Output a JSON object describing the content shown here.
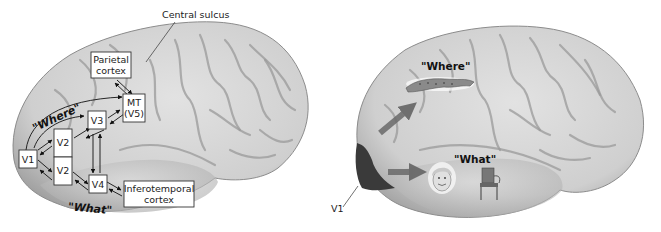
{
  "left_panel": {
    "central_sulcus_label": "Central sulcus",
    "boxes": {
      "parietal_line1": "Parietal",
      "parietal_line2": "cortex",
      "mt_line1": "MT",
      "mt_line2": "(V5)",
      "v3": "V3",
      "v2_upper": "V2",
      "v2_lower": "V2",
      "v1": "V1",
      "v4": "V4",
      "it_line1": "Inferotemporal",
      "it_line2": "cortex"
    },
    "where_label": "\"Where\"",
    "what_label": "\"What\""
  },
  "right_panel": {
    "where_label": "\"Where\"",
    "what_label": "\"What\"",
    "v1_label": "V1",
    "where_icon": "cheetah-icon",
    "what_icons": [
      "face-icon",
      "chair-icon"
    ]
  },
  "colors": {
    "brain_fill": "#d4d4d4",
    "brain_shadow": "#a8a8a8",
    "v1_region": "#3a3a3a",
    "arrow_fill": "#6a6a6a",
    "text": "#111111"
  }
}
